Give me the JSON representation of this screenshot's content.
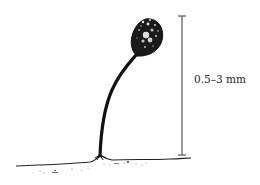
{
  "figure": {
    "scale_bar": {
      "label": "0.5–3 mm",
      "color": "#555555"
    },
    "colors": {
      "ink": "#111111",
      "background": "#ffffff"
    }
  }
}
